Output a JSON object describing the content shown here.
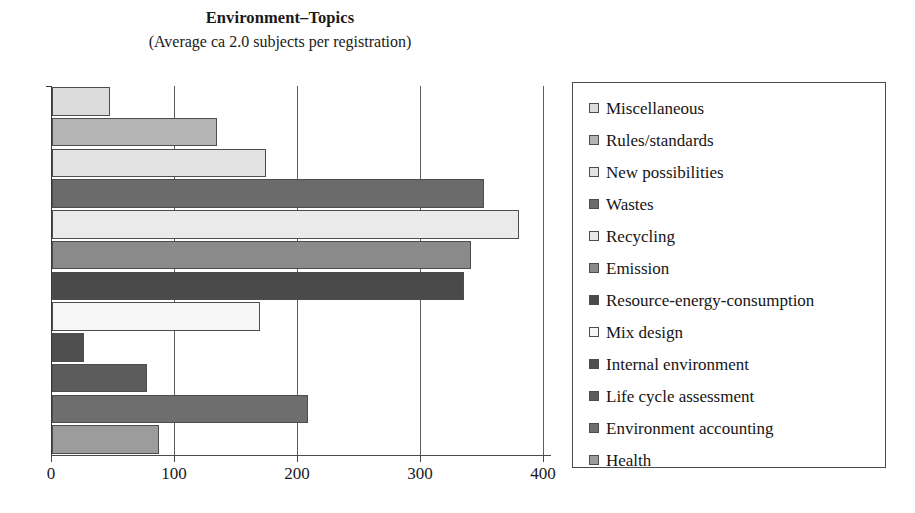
{
  "chart_data": {
    "type": "bar",
    "orientation": "horizontal",
    "title": "Environment–Topics",
    "subtitle": "(Average ca 2.0 subjects per registration)",
    "xlabel": "",
    "ylabel": "",
    "xlim": [
      0,
      400
    ],
    "xticks": [
      0,
      100,
      200,
      300,
      400
    ],
    "xtick_labels": [
      "0",
      "100",
      "200",
      "300",
      "400"
    ],
    "grid": "vertical",
    "legend_position": "right",
    "categories": [
      "Miscellaneous",
      "Rules/standards",
      "New possibilities",
      "Wastes",
      "Recycling",
      "Emission",
      "Resource-energy-consumption",
      "Mix design",
      "Internal environment",
      "Life cycle assessment",
      "Environment accounting",
      "Health"
    ],
    "values": [
      47,
      134,
      174,
      351,
      380,
      341,
      335,
      169,
      26,
      77,
      208,
      87
    ],
    "colors": [
      "#dcdcdc",
      "#b4b4b4",
      "#e3e3e3",
      "#6b6b6b",
      "#eaeaea",
      "#8a8a8a",
      "#4a4a4a",
      "#f6f6f6",
      "#4f4f4f",
      "#5c5c5c",
      "#6e6e6e",
      "#9c9c9c"
    ]
  },
  "legend": {
    "items": [
      {
        "label": "Miscellaneous",
        "color": "#dcdcdc"
      },
      {
        "label": "Rules/standards",
        "color": "#b4b4b4"
      },
      {
        "label": "New possibilities",
        "color": "#e3e3e3"
      },
      {
        "label": "Wastes",
        "color": "#6b6b6b"
      },
      {
        "label": "Recycling",
        "color": "#eaeaea"
      },
      {
        "label": "Emission",
        "color": "#8a8a8a"
      },
      {
        "label": "Resource-energy-consumption",
        "color": "#4a4a4a"
      },
      {
        "label": "Mix design",
        "color": "#f6f6f6"
      },
      {
        "label": "Internal environment",
        "color": "#4f4f4f"
      },
      {
        "label": "Life cycle assessment",
        "color": "#5c5c5c"
      },
      {
        "label": "Environment accounting",
        "color": "#6e6e6e"
      },
      {
        "label": "Health",
        "color": "#9c9c9c"
      }
    ]
  }
}
